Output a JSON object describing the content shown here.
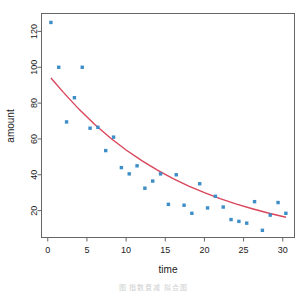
{
  "chart_data": {
    "type": "scatter",
    "title": "",
    "xlabel": "time",
    "ylabel": "amount",
    "xlim": [
      -0.8,
      31.5
    ],
    "ylim": [
      5,
      130
    ],
    "xticks": [
      0,
      5,
      10,
      15,
      20,
      25,
      30
    ],
    "yticks": [
      20,
      40,
      60,
      80,
      100,
      120
    ],
    "grid": false,
    "legend": null,
    "point_color": "#3c8dc8",
    "line_color": "#d9455a",
    "point_symbol": "filled-square",
    "series": [
      {
        "name": "observed",
        "type": "scatter",
        "x": [
          0.4,
          1.4,
          2.4,
          3.4,
          4.4,
          5.4,
          6.4,
          7.4,
          8.4,
          9.4,
          10.4,
          11.4,
          12.4,
          13.4,
          14.4,
          15.4,
          16.4,
          17.4,
          18.4,
          19.4,
          20.4,
          21.4,
          22.4,
          23.4,
          24.4,
          25.4,
          26.4,
          27.4,
          28.4,
          29.4,
          30.4
        ],
        "y": [
          125,
          100,
          69.5,
          83,
          100,
          66,
          66.5,
          53.5,
          61,
          44,
          40.5,
          45,
          32.5,
          36.5,
          40.5,
          23.5,
          40,
          23,
          18.5,
          35,
          21.5,
          28,
          22,
          15,
          14,
          13,
          25,
          9,
          17.5,
          24.5,
          18.5
        ]
      },
      {
        "name": "exponential fit",
        "type": "line",
        "x": [
          0.4,
          2,
          4,
          6,
          8,
          10,
          12,
          14,
          16,
          18,
          20,
          22,
          24,
          26,
          28,
          30.4
        ],
        "y": [
          94,
          86,
          76.5,
          68,
          60.5,
          53.8,
          47.9,
          42.6,
          37.9,
          33.7,
          30,
          26.7,
          23.8,
          21.2,
          18.8,
          16.3
        ]
      }
    ]
  },
  "caption": {
    "text": "图     指数衰减 拟合图"
  }
}
